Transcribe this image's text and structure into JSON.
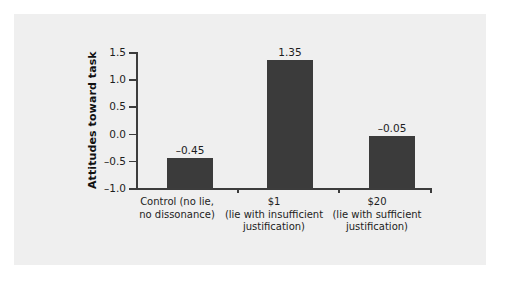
{
  "chart_data": {
    "type": "bar",
    "title": "",
    "xlabel": "",
    "ylabel": "Attitudes toward task",
    "ylim": [
      -1.0,
      1.5
    ],
    "yticks": [
      "1.5",
      "1.0",
      "0.5",
      "0.0",
      "–0.5",
      "–1.0"
    ],
    "ytick_values": [
      1.5,
      1.0,
      0.5,
      0.0,
      -0.5,
      -1.0
    ],
    "grid": false,
    "legend": null,
    "baseline": -1.0,
    "categories": [
      "Control (no lie, no dissonance)",
      "$1 (lie with insufficient justification)",
      "$20 (lie with sufficient justification)"
    ],
    "category_lines": [
      [
        "Control (no lie,",
        "no dissonance)"
      ],
      [
        "$1",
        "(lie with insufficient",
        "justification)"
      ],
      [
        "$20",
        "(lie with sufficient",
        "justification)"
      ]
    ],
    "values": [
      -0.45,
      1.35,
      -0.05
    ],
    "value_labels": [
      "–0.45",
      "1.35",
      "–0.05"
    ],
    "bar_color": "#3b3b3b",
    "panel_color": "#efefef",
    "axis_color": "#3c3c3c"
  }
}
